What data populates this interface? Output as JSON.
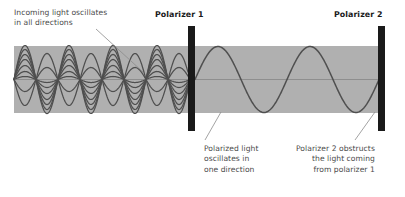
{
  "diagram": {
    "colors": {
      "beam_band": "#b0b0b0",
      "wave_stroke": "#4f4f4f",
      "polarizer_bar": "#1a1a1a",
      "annotation_text": "#4a4a4a",
      "label_text": "#1a1a1a",
      "leader_line": "#8c8c8c",
      "background": "#ffffff"
    }
  },
  "labels": {
    "incoming": "Incoming light oscillates\nin all directions",
    "polarizer1": "Polarizer 1",
    "polarizer2": "Polarizer 2",
    "polarized_light": "Polarized light\noscillates in\none direction",
    "obstructs": "Polarizer 2 obstructs\nthe light coming\nfrom polarizer 1"
  },
  "chart_data": {
    "type": "line",
    "xlabel": "",
    "ylabel": "",
    "grid": false,
    "legend": null,
    "axis_line_y": 79.5,
    "beam_band": {
      "x": 14,
      "y": 46,
      "width": 371,
      "height": 67
    },
    "polarizers": [
      {
        "name": "Polarizer 1",
        "x": 188,
        "y": 26,
        "width": 7,
        "height": 105
      },
      {
        "name": "Polarizer 2",
        "x": 378,
        "y": 26,
        "width": 7,
        "height": 105
      }
    ],
    "unpolarized_section": {
      "x_start": 14,
      "x_end": 188,
      "wavelength": 44,
      "node_count": 5,
      "wave_count": 9,
      "amplitudes": [
        34,
        30,
        25,
        20,
        14,
        8,
        3,
        -12,
        -26
      ],
      "description": "Overlapping sine waves of many amplitudes sharing common nodes"
    },
    "polarized_section": {
      "x_start": 195,
      "x_end": 382,
      "wavelength": 92,
      "amplitude": 33,
      "cycles": 2,
      "description": "Single sine wave in one plane"
    },
    "leader_lines": [
      {
        "from": [
          96,
          29
        ],
        "to": [
          143,
          72
        ],
        "label": "incoming"
      },
      {
        "from": [
          205,
          140
        ],
        "to": [
          221,
          112
        ],
        "label": "polarized_light"
      },
      {
        "from": [
          355,
          140
        ],
        "to": [
          375,
          112
        ],
        "label": "obstructs"
      }
    ]
  }
}
